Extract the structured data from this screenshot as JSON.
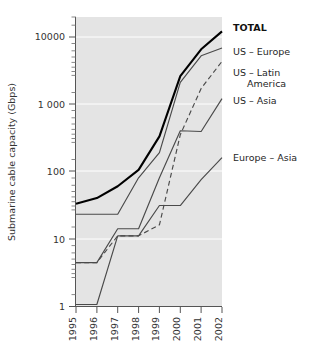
{
  "chart_data": {
    "type": "line",
    "title": "",
    "xlabel": "",
    "ylabel": "Submarine cable capacity (Gbps)",
    "x": [
      1995,
      1996,
      1997,
      1998,
      1999,
      2000,
      2001,
      2002
    ],
    "categories": [
      "1995",
      "1996",
      "1997",
      "1998",
      "1999",
      "2000",
      "2001",
      "2002"
    ],
    "xlim": [
      1995,
      2002
    ],
    "ylim": [
      1,
      20000
    ],
    "yscale": "log",
    "ytick_labels": [
      "10000",
      "1 000",
      "100",
      "10",
      "1"
    ],
    "ytick_values": [
      10000,
      1000,
      100,
      10,
      1
    ],
    "grid": "horizontal-white-at-decades",
    "legend_position": "right-of-plot-at-line-ends",
    "series": [
      {
        "name": "TOTAL",
        "label": "TOTAL",
        "style": "solid-thick",
        "color": "#000000",
        "values": [
          33,
          40,
          60,
          105,
          330,
          2600,
          6500,
          12000
        ]
      },
      {
        "name": "US – Europe",
        "label": "US – Europe",
        "style": "solid",
        "color": "#4a4a4a",
        "values": [
          23,
          23,
          23,
          80,
          190,
          2100,
          5200,
          6800
        ]
      },
      {
        "name": "US – Latin America",
        "label": "US – Latin",
        "label_line2": "America",
        "style": "dashed",
        "color": "#4a4a4a",
        "values": [
          4.4,
          4.4,
          11,
          11,
          16,
          350,
          1700,
          4300
        ]
      },
      {
        "name": "US – Asia",
        "label": "US – Asia",
        "style": "solid",
        "color": "#4a4a4a",
        "values": [
          4.4,
          4.4,
          14,
          14,
          80,
          400,
          390,
          1200
        ]
      },
      {
        "name": "Europe – Asia",
        "label": "Europe – Asia",
        "style": "solid",
        "color": "#4a4a4a",
        "values": [
          1.05,
          1.05,
          11,
          11,
          31,
          31,
          75,
          160
        ]
      }
    ]
  },
  "axis": {
    "y_title": "Submarine cable capacity (Gbps)",
    "y_labels": [
      "10000",
      "1 000",
      "100",
      "10",
      "1"
    ],
    "x_labels": [
      "1995",
      "1996",
      "1997",
      "1998",
      "1999",
      "2000",
      "2001",
      "2002"
    ]
  },
  "legend": {
    "total": "TOTAL",
    "us_europe": "US – Europe",
    "us_latin_1": "US – Latin",
    "us_latin_2": "America",
    "us_asia": "US – Asia",
    "europe_asia": "Europe – Asia"
  },
  "colors": {
    "plot_background": "#e4e4e4",
    "gridline": "#ffffff",
    "axis": "#555555",
    "series": "#4a4a4a",
    "total": "#000000",
    "text": "#2b2b2b"
  }
}
